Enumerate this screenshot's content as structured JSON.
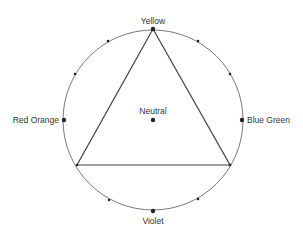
{
  "diagram": {
    "type": "color-harmony-circle",
    "colors": {
      "stroke": "#555555",
      "triangle": "#444444",
      "dot": "#222222",
      "text": "#333333"
    },
    "circle": {
      "cx": 153,
      "cy": 120,
      "r": 90
    },
    "triangle": {
      "vertices": [
        {
          "x": 153,
          "y": 29
        },
        {
          "x": 77,
          "y": 165
        },
        {
          "x": 230,
          "y": 165
        }
      ]
    },
    "labels": {
      "top": "Yellow",
      "left": "Red Orange",
      "right": "Blue Green",
      "bottom": "Violet",
      "center": "Neutral"
    },
    "major_points": [
      {
        "name": "Yellow",
        "x": 153,
        "y": 29
      },
      {
        "name": "Red Orange",
        "x": 64,
        "y": 120
      },
      {
        "name": "Blue Green",
        "x": 242,
        "y": 120
      },
      {
        "name": "Violet",
        "x": 153,
        "y": 211
      },
      {
        "name": "Neutral",
        "x": 153,
        "y": 120
      }
    ],
    "minor_points": [
      {
        "x": 108,
        "y": 41
      },
      {
        "x": 75,
        "y": 74
      },
      {
        "x": 198,
        "y": 41
      },
      {
        "x": 230,
        "y": 74
      },
      {
        "x": 77,
        "y": 165
      },
      {
        "x": 230,
        "y": 165
      },
      {
        "x": 109,
        "y": 200
      },
      {
        "x": 198,
        "y": 199
      }
    ]
  }
}
